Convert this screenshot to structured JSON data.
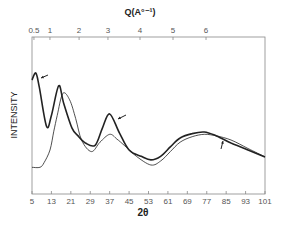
{
  "chart_data": {
    "type": "line",
    "title": "",
    "xlabel": "2θ",
    "xlabel_top": "Q (A°⁻¹)",
    "ylabel": "INTENSITY",
    "xlim": [
      5,
      101
    ],
    "ylim": [
      0,
      100
    ],
    "grid": false,
    "legend": "none (curves marked by arrows)",
    "x_ticks": [
      5,
      13,
      21,
      29,
      37,
      45,
      53,
      61,
      69,
      77,
      85,
      93,
      101
    ],
    "x_tick_labels": [
      "5",
      "13",
      "21",
      "29",
      "37",
      "45",
      "53",
      "61",
      "69",
      "77",
      "85",
      "93",
      "101"
    ],
    "top_ticks": [
      {
        "label": "0.5",
        "two_theta": 5.8
      },
      {
        "label": "1",
        "two_theta": 12.4
      },
      {
        "label": "2",
        "two_theta": 24.4
      },
      {
        "label": "3",
        "two_theta": 36.3
      },
      {
        "label": "4",
        "two_theta": 49.5
      },
      {
        "label": "5",
        "two_theta": 63.1
      },
      {
        "label": "6",
        "two_theta": 76.7
      }
    ],
    "series": [
      {
        "name": "curve A (arrow-marked, thick)",
        "x": [
          5,
          6.6,
          8,
          11,
          13,
          16,
          18,
          21.5,
          24,
          27,
          31,
          34,
          37,
          41,
          45,
          50,
          54,
          58,
          62,
          66,
          71,
          76,
          81,
          87,
          94,
          101
        ],
        "values": [
          72.6,
          77,
          68,
          43,
          50,
          69,
          58,
          42,
          37,
          32.5,
          31,
          42,
          51,
          39,
          28,
          24,
          21.7,
          24,
          30,
          35.7,
          38.5,
          39.5,
          37,
          32.5,
          28,
          23.6
        ]
      },
      {
        "name": "curve B (thin)",
        "x": [
          5,
          8.3,
          10,
          12.4,
          14,
          15.4,
          17.7,
          20.5,
          23,
          25.5,
          29.5,
          33,
          37,
          40,
          43,
          48,
          54,
          58,
          62,
          66,
          71,
          76,
          81,
          87,
          94,
          101
        ],
        "values": [
          17,
          17,
          20,
          28,
          40,
          50,
          64,
          60,
          48,
          34,
          27,
          33,
          38,
          35,
          31,
          24,
          18.5,
          21,
          27,
          33,
          36.5,
          38,
          37,
          34.4,
          29,
          23.6
        ]
      }
    ],
    "annotations": [
      {
        "type": "arrow",
        "target": "curve A",
        "near_two_theta": 9
      },
      {
        "type": "arrow",
        "target": "curve A",
        "near_two_theta": 40
      },
      {
        "type": "arrow",
        "target": "curve A",
        "near_two_theta": 84
      }
    ]
  },
  "labels": {
    "top_axis_title": "Q(A°⁻¹)",
    "bottom_axis_title": "2θ",
    "y_axis_title": "INTENSITY"
  }
}
